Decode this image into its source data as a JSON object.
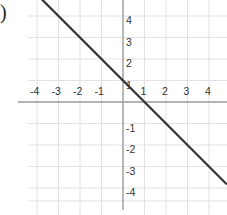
{
  "label": ")",
  "chart_data": {
    "type": "line",
    "title": "",
    "xlabel": "",
    "ylabel": "",
    "xlim": [
      -5.3,
      4.8
    ],
    "ylim": [
      -5.2,
      4.8
    ],
    "grid": true,
    "x_ticks": [
      "-4",
      "-3",
      "-2",
      "-1",
      "1",
      "2",
      "3",
      "4"
    ],
    "y_ticks": [
      "4",
      "3",
      "2",
      "1",
      "-1",
      "-2",
      "-3",
      "-4"
    ],
    "series": [
      {
        "name": "y = -x + 1",
        "equation": "y = -x + 1",
        "points": [
          [
            -4.4,
            5.4
          ],
          [
            0,
            1
          ],
          [
            1,
            0
          ],
          [
            4.8,
            -3.8
          ]
        ],
        "color": "#333333"
      }
    ]
  },
  "colors": {
    "grid": "#e2e2e2",
    "axis": "#9a9a9a",
    "line": "#333333",
    "text": "#333333"
  }
}
